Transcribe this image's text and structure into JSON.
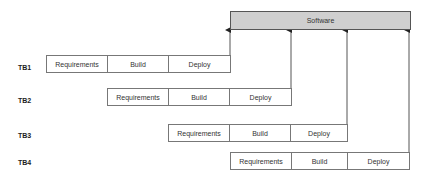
{
  "software": {
    "label": "Software"
  },
  "rows": [
    {
      "label": "TB1",
      "phases": [
        "Requirements",
        "Build",
        "Deploy"
      ]
    },
    {
      "label": "TB2",
      "phases": [
        "Requirements",
        "Build",
        "Deploy"
      ]
    },
    {
      "label": "TB3",
      "phases": [
        "Requirements",
        "Build",
        "Deploy"
      ]
    },
    {
      "label": "TB4",
      "phases": [
        "Requirements",
        "Build",
        "Deploy"
      ]
    }
  ],
  "colors": {
    "software_fill": "#cfcfcf",
    "border": "#555555",
    "line": "#444444"
  }
}
